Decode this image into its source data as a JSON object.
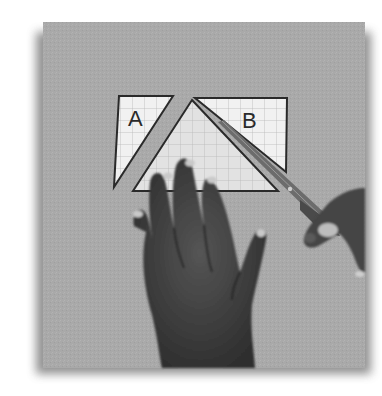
{
  "image": {
    "description": "Photograph of a hand holding down a paper parallelogram on grid paper while another hand cuts it with scissors, rearranging triangle pieces A and B",
    "labels": {
      "piece_a": "A",
      "piece_b": "B"
    },
    "colors": {
      "backdrop": "#a9a9a9",
      "backdrop_shadow": "#7a7a7a",
      "paper": "#f1f1f1",
      "paper_middle": "#e2e2e2",
      "grid_line": "#b8b8b8",
      "outline": "#2a2a2a",
      "skin": "#4a4a4a",
      "skin_dark": "#333333",
      "nail": "#c9c9c9",
      "scissors": "#6c6c6c"
    }
  }
}
